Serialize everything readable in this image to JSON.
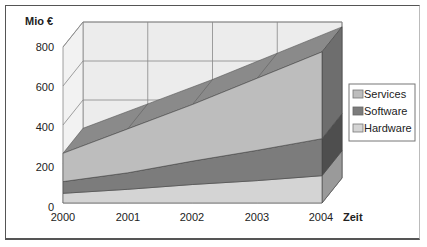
{
  "chart_data": {
    "type": "area",
    "variant": "3d-stacked-area",
    "title": "",
    "xlabel": "Zeit",
    "ylabel": "Mio €",
    "categories": [
      "2000",
      "2001",
      "2002",
      "2003",
      "2004"
    ],
    "series": [
      {
        "name": "Hardware",
        "values": [
          50,
          70,
          95,
          115,
          140
        ],
        "color": "#d4d4d4"
      },
      {
        "name": "Software",
        "values": [
          60,
          85,
          120,
          155,
          190
        ],
        "color": "#7c7c7c"
      },
      {
        "name": "Services",
        "values": [
          145,
          225,
          290,
          370,
          445
        ],
        "color": "#bdbdbd"
      }
    ],
    "yticks": [
      "0",
      "200",
      "400",
      "600",
      "800"
    ],
    "ylim": [
      0,
      800
    ],
    "grid": true,
    "legend": {
      "position": "right",
      "order": [
        "Services",
        "Software",
        "Hardware"
      ]
    }
  },
  "axis": {
    "y_title": "Mio €",
    "x_title": "Zeit",
    "y_ticks": [
      "800",
      "600",
      "400",
      "200",
      "0"
    ],
    "x_ticks": [
      "2000",
      "2001",
      "2002",
      "2003",
      "2004"
    ]
  },
  "legend": {
    "items": [
      {
        "label": "Services",
        "color": "#bdbdbd"
      },
      {
        "label": "Software",
        "color": "#7c7c7c"
      },
      {
        "label": "Hardware",
        "color": "#d4d4d4"
      }
    ]
  }
}
